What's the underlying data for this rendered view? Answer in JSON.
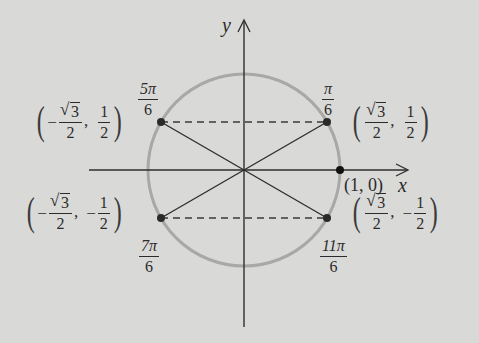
{
  "figure": {
    "type": "unit-circle",
    "background": "#d9d9d7",
    "circle_color": "#a8a8a6",
    "line_color": "#2e2e2e",
    "axes": {
      "x_label": "x",
      "y_label": "y"
    },
    "center_px": [
      244,
      170
    ],
    "radius_px": 96,
    "points": [
      {
        "id": "pi_6",
        "angle": "π/6",
        "angle_num": "π",
        "angle_den": "6",
        "coord_x_num": "√3",
        "coord_x_sign": "",
        "coord_x_den": "2",
        "coord_y_sign": "",
        "coord_y_num": "1",
        "coord_y_den": "2"
      },
      {
        "id": "5pi_6",
        "angle": "5π/6",
        "angle_num": "5π",
        "angle_den": "6",
        "coord_x_sign": "−",
        "coord_x_num": "√3",
        "coord_x_den": "2",
        "coord_y_sign": "",
        "coord_y_num": "1",
        "coord_y_den": "2"
      },
      {
        "id": "7pi_6",
        "angle": "7π/6",
        "angle_num": "7π",
        "angle_den": "6",
        "coord_x_sign": "−",
        "coord_x_num": "√3",
        "coord_x_den": "2",
        "coord_y_sign": "−",
        "coord_y_num": "1",
        "coord_y_den": "2"
      },
      {
        "id": "11pi_6",
        "angle": "11π/6",
        "angle_num": "11π",
        "angle_den": "6",
        "coord_x_sign": "",
        "coord_x_num": "√3",
        "coord_x_den": "2",
        "coord_y_sign": "−",
        "coord_y_num": "1",
        "coord_y_den": "2"
      }
    ],
    "point_1_0": {
      "label": "(1, 0)"
    }
  }
}
